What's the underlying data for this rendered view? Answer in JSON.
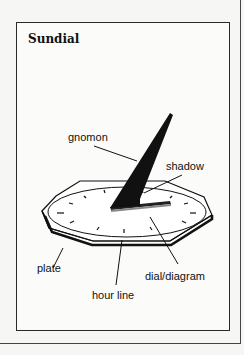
{
  "figure": {
    "title": "Sundial",
    "labels": {
      "gnomon": "gnomon",
      "shadow": "shadow",
      "plate": "plate",
      "hour_line": "hour line",
      "dial": "dial/diagram"
    }
  }
}
